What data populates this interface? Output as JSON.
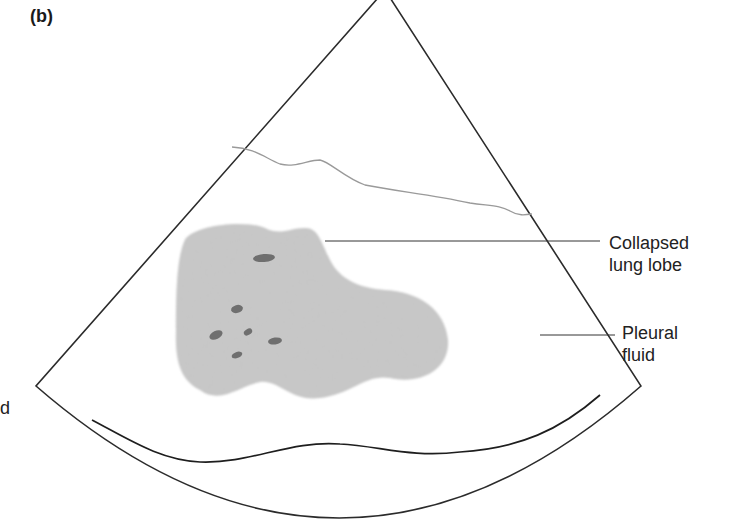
{
  "figure": {
    "panel_label": "(b)",
    "labels": {
      "collapsed_lung_lobe": {
        "line1": "Collapsed",
        "line2": "lung lobe"
      },
      "pleural_fluid": {
        "line1": "Pleural",
        "line2": "fluid"
      },
      "cut_off_left_text": "d"
    },
    "colors": {
      "outline": "#2b2b2b",
      "lobe_fill": "#c8c8c8",
      "lobe_spots": "#6e6e6e",
      "pleural_line": "#9a9a9a",
      "diaphragm": "#1e1e1e",
      "leader_line": "#333333"
    }
  }
}
